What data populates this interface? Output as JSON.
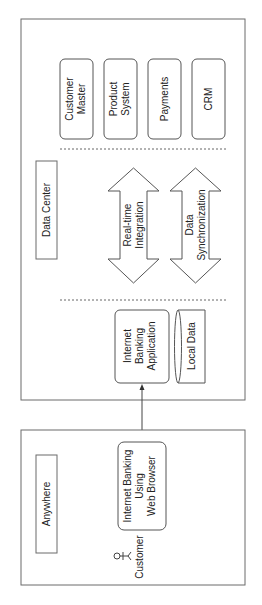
{
  "diagram": {
    "data_center": {
      "label": "Data Center",
      "systems": [
        {
          "line1": "Customer",
          "line2": "Master"
        },
        {
          "line1": "Product",
          "line2": "System"
        },
        {
          "line1": "Payments",
          "line2": ""
        },
        {
          "line1": "CRM",
          "line2": ""
        }
      ],
      "integrations": [
        {
          "line1": "Real-time",
          "line2": "Integration"
        },
        {
          "line1": "Data",
          "line2": "Synchronization"
        }
      ],
      "application": {
        "line1": "Internet",
        "line2": "Banking",
        "line3": "Application"
      },
      "local_data": "Local Data"
    },
    "anywhere": {
      "label": "Anywhere",
      "client": {
        "line1": "Internet Banking",
        "line2": "Using",
        "line3": "Web Browser"
      },
      "actor": "Customer"
    },
    "colors": {
      "stroke": "#555555",
      "background": "#ffffff"
    }
  }
}
